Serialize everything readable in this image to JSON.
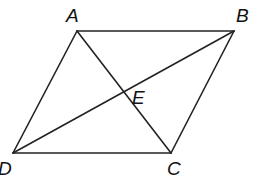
{
  "diagram": {
    "type": "parallelogram with diagonals",
    "stroke_color": "#222222",
    "vertices": [
      {
        "label": "A",
        "x": 77,
        "y": 31,
        "lx": 66,
        "ly": 6
      },
      {
        "label": "B",
        "x": 234,
        "y": 31,
        "lx": 236,
        "ly": 6
      },
      {
        "label": "C",
        "x": 171,
        "y": 153,
        "lx": 167,
        "ly": 159
      },
      {
        "label": "D",
        "x": 13,
        "y": 153,
        "lx": -2,
        "ly": 159
      }
    ],
    "intersection": {
      "label": "E",
      "x": 124,
      "y": 92,
      "lx": 132,
      "ly": 88
    },
    "segments": [
      [
        "A",
        "B"
      ],
      [
        "B",
        "C"
      ],
      [
        "C",
        "D"
      ],
      [
        "D",
        "A"
      ],
      [
        "A",
        "C"
      ],
      [
        "B",
        "D"
      ]
    ]
  }
}
